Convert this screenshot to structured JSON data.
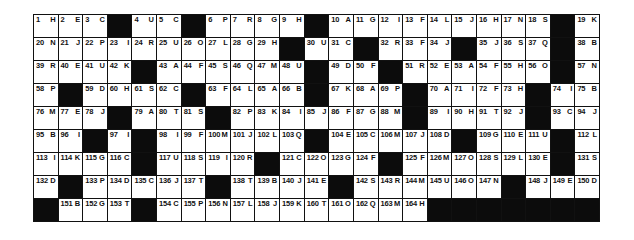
{
  "puzzle": {
    "columns": 23,
    "rows": 9,
    "black_color": "#0c0c0c",
    "grid": [
      [
        [
          "1",
          "H"
        ],
        [
          "2",
          "E"
        ],
        [
          "3",
          "C"
        ],
        null,
        [
          "4",
          "U"
        ],
        [
          "5",
          "C"
        ],
        null,
        [
          "6",
          "P"
        ],
        [
          "7",
          "R"
        ],
        [
          "8",
          "G"
        ],
        [
          "9",
          "H"
        ],
        null,
        [
          "10",
          "A"
        ],
        [
          "11",
          "G"
        ],
        [
          "12",
          "I"
        ],
        [
          "13",
          "F"
        ],
        [
          "14",
          "L"
        ],
        [
          "15",
          "J"
        ],
        [
          "16",
          "H"
        ],
        [
          "17",
          "N"
        ],
        [
          "18",
          "S"
        ],
        null,
        [
          "19",
          "K"
        ]
      ],
      [
        [
          "20",
          "N"
        ],
        [
          "21",
          "J"
        ],
        [
          "22",
          "P"
        ],
        [
          "23",
          "I"
        ],
        [
          "24",
          "R"
        ],
        [
          "25",
          "U"
        ],
        [
          "26",
          "O"
        ],
        [
          "27",
          "L"
        ],
        [
          "28",
          "G"
        ],
        [
          "29",
          "H"
        ],
        null,
        [
          "30",
          "U"
        ],
        [
          "31",
          "C"
        ],
        null,
        [
          "32",
          "R"
        ],
        [
          "33",
          "F"
        ],
        [
          "34",
          "J"
        ],
        null,
        [
          "35",
          "J"
        ],
        [
          "36",
          "S"
        ],
        [
          "37",
          "Q"
        ],
        null,
        [
          "38",
          "B"
        ]
      ],
      [
        [
          "39",
          "R"
        ],
        [
          "40",
          "E"
        ],
        [
          "41",
          "U"
        ],
        [
          "42",
          "K"
        ],
        null,
        [
          "43",
          "A"
        ],
        [
          "44",
          "F"
        ],
        [
          "45",
          "S"
        ],
        [
          "46",
          "Q"
        ],
        [
          "47",
          "M"
        ],
        [
          "48",
          "U"
        ],
        null,
        [
          "49",
          "D"
        ],
        [
          "50",
          "F"
        ],
        null,
        [
          "51",
          "R"
        ],
        [
          "52",
          "E"
        ],
        [
          "53",
          "A"
        ],
        [
          "54",
          "F"
        ],
        [
          "55",
          "H"
        ],
        [
          "56",
          "O"
        ],
        null,
        [
          "57",
          "N"
        ]
      ],
      [
        [
          "58",
          "P"
        ],
        null,
        [
          "59",
          "D"
        ],
        [
          "60",
          "H"
        ],
        [
          "61",
          "S"
        ],
        [
          "62",
          "C"
        ],
        null,
        [
          "63",
          "F"
        ],
        [
          "64",
          "L"
        ],
        [
          "65",
          "A"
        ],
        [
          "66",
          "B"
        ],
        null,
        [
          "67",
          "K"
        ],
        [
          "68",
          "A"
        ],
        [
          "69",
          "P"
        ],
        null,
        [
          "70",
          "A"
        ],
        [
          "71",
          "I"
        ],
        [
          "72",
          "F"
        ],
        [
          "73",
          "H"
        ],
        null,
        [
          "74",
          "I"
        ],
        [
          "75",
          "B"
        ]
      ],
      [
        [
          "76",
          "M"
        ],
        [
          "77",
          "E"
        ],
        [
          "78",
          "J"
        ],
        null,
        [
          "79",
          "A"
        ],
        [
          "80",
          "T"
        ],
        [
          "81",
          "S"
        ],
        null,
        [
          "82",
          "P"
        ],
        [
          "83",
          "K"
        ],
        [
          "84",
          "I"
        ],
        [
          "85",
          "J"
        ],
        [
          "86",
          "F"
        ],
        [
          "87",
          "G"
        ],
        [
          "88",
          "M"
        ],
        null,
        [
          "89",
          "I"
        ],
        [
          "90",
          "H"
        ],
        [
          "91",
          "T"
        ],
        [
          "92",
          "J"
        ],
        null,
        [
          "93",
          "C"
        ],
        [
          "94",
          "J"
        ]
      ],
      [
        [
          "95",
          "B"
        ],
        [
          "96",
          "I"
        ],
        null,
        [
          "97",
          "I"
        ],
        null,
        [
          "98",
          "I"
        ],
        [
          "99",
          "F"
        ],
        [
          "100",
          "M"
        ],
        [
          "101",
          "J"
        ],
        [
          "102",
          "L"
        ],
        [
          "103",
          "Q"
        ],
        null,
        [
          "104",
          "E"
        ],
        [
          "105",
          "C"
        ],
        [
          "106",
          "M"
        ],
        [
          "107",
          "J"
        ],
        [
          "108",
          "D"
        ],
        null,
        [
          "109",
          "G"
        ],
        [
          "110",
          "E"
        ],
        [
          "111",
          "U"
        ],
        null,
        [
          "112",
          "L"
        ]
      ],
      [
        [
          "113",
          "I"
        ],
        [
          "114",
          "K"
        ],
        [
          "115",
          "G"
        ],
        [
          "116",
          "C"
        ],
        null,
        [
          "117",
          "U"
        ],
        [
          "118",
          "S"
        ],
        [
          "119",
          "I"
        ],
        [
          "120",
          "R"
        ],
        null,
        [
          "121",
          "C"
        ],
        [
          "122",
          "O"
        ],
        [
          "123",
          "G"
        ],
        [
          "124",
          "F"
        ],
        null,
        [
          "125",
          "F"
        ],
        [
          "126",
          "M"
        ],
        [
          "127",
          "O"
        ],
        [
          "128",
          "S"
        ],
        [
          "129",
          "L"
        ],
        [
          "130",
          "E"
        ],
        null,
        [
          "131",
          "S"
        ]
      ],
      [
        [
          "132",
          "D"
        ],
        null,
        [
          "133",
          "P"
        ],
        [
          "134",
          "D"
        ],
        [
          "135",
          "C"
        ],
        [
          "136",
          "J"
        ],
        [
          "137",
          "T"
        ],
        null,
        [
          "138",
          "T"
        ],
        [
          "139",
          "B"
        ],
        [
          "140",
          "J"
        ],
        [
          "141",
          "E"
        ],
        null,
        [
          "142",
          "S"
        ],
        [
          "143",
          "R"
        ],
        [
          "144",
          "M"
        ],
        [
          "145",
          "U"
        ],
        [
          "146",
          "O"
        ],
        [
          "147",
          "N"
        ],
        null,
        [
          "148",
          "J"
        ],
        [
          "149",
          "E"
        ],
        [
          "150",
          "D"
        ]
      ],
      [
        null,
        [
          "151",
          "B"
        ],
        [
          "152",
          "G"
        ],
        [
          "153",
          "T"
        ],
        null,
        [
          "154",
          "C"
        ],
        [
          "155",
          "P"
        ],
        [
          "156",
          "N"
        ],
        [
          "157",
          "L"
        ],
        [
          "158",
          "J"
        ],
        [
          "159",
          "K"
        ],
        [
          "160",
          "T"
        ],
        [
          "161",
          "O"
        ],
        [
          "162",
          "Q"
        ],
        [
          "163",
          "M"
        ],
        [
          "164",
          "H"
        ],
        null,
        null,
        null,
        null,
        null,
        null,
        null
      ]
    ]
  }
}
